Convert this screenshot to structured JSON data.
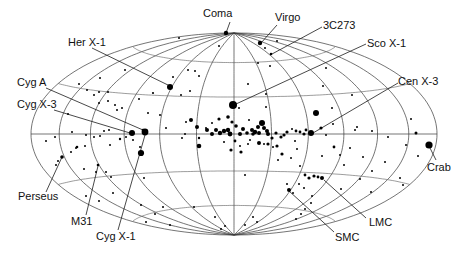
{
  "chart_data": {
    "type": "scatter",
    "title": "",
    "projection": "hammer-aitoff (galactic coordinates)",
    "xlabel": "",
    "ylabel": "",
    "grid": {
      "meridian_step_deg": 30,
      "parallel_step_deg": 30
    },
    "legend": null,
    "geometry": {
      "cx": 234,
      "cy": 134,
      "a": 203,
      "b": 101
    },
    "named_sources": [
      {
        "name": "Coma",
        "x": 226,
        "y": 33,
        "r": 2.2,
        "label_x": 203,
        "label_y": 17,
        "anchor": "start"
      },
      {
        "name": "Virgo",
        "x": 260,
        "y": 43,
        "r": 2.2,
        "label_x": 275,
        "label_y": 21,
        "anchor": "start"
      },
      {
        "name": "3C273",
        "x": 271,
        "y": 54,
        "r": 1.3,
        "label_x": 323,
        "label_y": 29,
        "anchor": "start"
      },
      {
        "name": "Sco X-1",
        "x": 233,
        "y": 105,
        "r": 4.0,
        "label_x": 367,
        "label_y": 47,
        "anchor": "start"
      },
      {
        "name": "Her X-1",
        "x": 170,
        "y": 87,
        "r": 3.0,
        "label_x": 68,
        "label_y": 46,
        "anchor": "start"
      },
      {
        "name": "Cyg A",
        "x": 143,
        "y": 130,
        "r": 1.3,
        "label_x": 17,
        "label_y": 86,
        "anchor": "start"
      },
      {
        "name": "Cyg X-3",
        "x": 132,
        "y": 133,
        "r": 3.0,
        "label_x": 17,
        "label_y": 108,
        "anchor": "start"
      },
      {
        "name": "Cen X-3",
        "x": 311,
        "y": 133,
        "r": 3.0,
        "label_x": 398,
        "label_y": 85,
        "anchor": "start"
      },
      {
        "name": "Crab",
        "x": 429,
        "y": 145,
        "r": 3.6,
        "label_x": 427,
        "label_y": 171,
        "anchor": "start"
      },
      {
        "name": "Perseus",
        "x": 62,
        "y": 157,
        "r": 1.8,
        "label_x": 18,
        "label_y": 200,
        "anchor": "start"
      },
      {
        "name": "M31",
        "x": 98,
        "y": 165,
        "r": 1.3,
        "label_x": 71,
        "label_y": 225,
        "anchor": "start"
      },
      {
        "name": "Cyg X-1",
        "x": 145,
        "y": 132,
        "r": 3.4,
        "label_x": 96,
        "label_y": 240,
        "anchor": "start"
      },
      {
        "name": "SMC",
        "x": 289,
        "y": 190,
        "r": 2.0,
        "label_x": 335,
        "label_y": 241,
        "anchor": "start"
      },
      {
        "name": "LMC",
        "x": 322,
        "y": 178,
        "r": 2.0,
        "label_x": 369,
        "label_y": 226,
        "anchor": "start"
      }
    ],
    "leader_lines": [
      {
        "name": "Coma",
        "from": [
          230,
          22
        ],
        "to": [
          226,
          33
        ]
      },
      {
        "name": "Virgo",
        "from": [
          277,
          25
        ],
        "to": [
          261,
          43
        ]
      },
      {
        "name": "3C273",
        "from": [
          322,
          27
        ],
        "to": [
          272,
          54
        ]
      },
      {
        "name": "Sco X-1",
        "from": [
          366,
          44
        ],
        "to": [
          236,
          104
        ]
      },
      {
        "name": "Her X-1",
        "from": [
          92,
          48
        ],
        "to": [
          170,
          86
        ]
      },
      {
        "name": "Cyg A",
        "from": [
          46,
          88
        ],
        "to": [
          143,
          130
        ]
      },
      {
        "name": "Cyg X-3",
        "from": [
          54,
          110
        ],
        "to": [
          130,
          133
        ]
      },
      {
        "name": "Cen X-3",
        "from": [
          398,
          83
        ],
        "to": [
          313,
          133
        ]
      },
      {
        "name": "Crab",
        "from": [
          436,
          160
        ],
        "to": [
          430,
          148
        ]
      },
      {
        "name": "Perseus",
        "from": [
          46,
          192
        ],
        "to": [
          62,
          157
        ]
      },
      {
        "name": "M31",
        "from": [
          86,
          215
        ],
        "to": [
          98,
          166
        ]
      },
      {
        "name": "Cyg X-1",
        "from": [
          118,
          230
        ],
        "to": [
          145,
          135
        ]
      },
      {
        "name": "SMC",
        "from": [
          334,
          232
        ],
        "to": [
          289,
          191
        ]
      },
      {
        "name": "LMC",
        "from": [
          366,
          218
        ],
        "to": [
          324,
          180
        ]
      }
    ],
    "sources": [
      [
        179,
        38,
        1.0
      ],
      [
        219,
        46,
        1.0
      ],
      [
        258,
        63,
        1.0
      ],
      [
        277,
        41,
        1.0
      ],
      [
        265,
        48,
        1.0
      ],
      [
        270,
        66,
        1.0
      ],
      [
        125,
        70,
        1.0
      ],
      [
        100,
        78,
        1.0
      ],
      [
        79,
        84,
        1.0
      ],
      [
        173,
        77,
        1.0
      ],
      [
        190,
        91,
        1.0
      ],
      [
        199,
        76,
        1.0
      ],
      [
        188,
        70,
        1.0
      ],
      [
        195,
        71,
        1.0
      ],
      [
        153,
        93,
        1.1
      ],
      [
        181,
        95,
        1.0
      ],
      [
        160,
        115,
        1.0
      ],
      [
        186,
        122,
        1.0
      ],
      [
        166,
        128,
        1.0
      ],
      [
        94,
        95,
        1.0
      ],
      [
        99,
        92,
        1.0
      ],
      [
        99,
        103,
        1.0
      ],
      [
        87,
        90,
        1.0
      ],
      [
        108,
        92,
        1.0
      ],
      [
        108,
        101,
        1.0
      ],
      [
        117,
        110,
        1.0
      ],
      [
        115,
        105,
        1.0
      ],
      [
        122,
        108,
        1.0
      ],
      [
        139,
        99,
        1.0
      ],
      [
        148,
        113,
        1.0
      ],
      [
        68,
        114,
        1.0
      ],
      [
        55,
        137,
        1.0
      ],
      [
        72,
        132,
        1.0
      ],
      [
        86,
        135,
        1.0
      ],
      [
        94,
        137,
        1.0
      ],
      [
        104,
        131,
        1.0
      ],
      [
        109,
        130,
        1.0
      ],
      [
        126,
        137,
        1.0
      ],
      [
        100,
        136,
        1.0
      ],
      [
        77,
        147,
        1.3
      ],
      [
        133,
        140,
        1.0
      ],
      [
        110,
        145,
        1.0
      ],
      [
        120,
        139,
        1.2
      ],
      [
        140,
        147,
        1.0
      ],
      [
        141,
        153,
        3.1
      ],
      [
        46,
        141,
        1.0
      ],
      [
        76,
        148,
        1.0
      ],
      [
        71,
        152,
        1.0
      ],
      [
        58,
        161,
        1.0
      ],
      [
        56,
        165,
        1.0
      ],
      [
        84,
        169,
        1.0
      ],
      [
        85,
        146,
        1.0
      ],
      [
        96,
        172,
        1.0
      ],
      [
        106,
        172,
        1.0
      ],
      [
        111,
        177,
        1.0
      ],
      [
        86,
        196,
        1.0
      ],
      [
        99,
        201,
        1.0
      ],
      [
        113,
        193,
        1.0
      ],
      [
        144,
        178,
        1.0
      ],
      [
        141,
        205,
        1.0
      ],
      [
        163,
        207,
        1.0
      ],
      [
        155,
        214,
        1.0
      ],
      [
        146,
        222,
        1.0
      ],
      [
        170,
        225,
        1.0
      ],
      [
        194,
        207,
        1.0
      ],
      [
        215,
        217,
        1.0
      ],
      [
        182,
        138,
        1.0
      ],
      [
        185,
        134,
        1.0
      ],
      [
        199,
        146,
        2.3
      ],
      [
        199,
        138,
        1.2
      ],
      [
        224,
        142,
        1.0
      ],
      [
        239,
        108,
        1.0
      ],
      [
        249,
        120,
        1.0
      ],
      [
        206,
        128,
        1.0
      ],
      [
        212,
        123,
        1.0
      ],
      [
        191,
        120,
        2.0
      ],
      [
        197,
        127,
        2.0
      ],
      [
        207,
        130,
        2.0
      ],
      [
        212,
        134,
        2.0
      ],
      [
        216,
        130,
        2.0
      ],
      [
        220,
        133,
        2.2
      ],
      [
        224,
        131,
        2.2
      ],
      [
        228,
        130,
        2.2
      ],
      [
        230,
        134,
        2.4
      ],
      [
        236,
        126,
        1.8
      ],
      [
        240,
        134,
        2.0
      ],
      [
        243,
        129,
        2.0
      ],
      [
        247,
        133,
        1.8
      ],
      [
        252,
        130,
        2.0
      ],
      [
        255,
        132,
        2.2
      ],
      [
        258,
        127,
        2.0
      ],
      [
        232,
        122,
        1.6
      ],
      [
        228,
        117,
        1.8
      ],
      [
        219,
        119,
        1.6
      ],
      [
        235,
        141,
        1.4
      ],
      [
        240,
        146,
        1.0
      ],
      [
        248,
        144,
        1.0
      ],
      [
        253,
        134,
        1.8
      ],
      [
        259,
        133,
        2.0
      ],
      [
        264,
        128,
        2.0
      ],
      [
        267,
        131,
        2.0
      ],
      [
        262,
        123,
        3.0
      ],
      [
        268,
        134,
        2.0
      ],
      [
        272,
        138,
        1.6
      ],
      [
        276,
        133,
        1.6
      ],
      [
        281,
        137,
        1.6
      ],
      [
        259,
        143,
        2.0
      ],
      [
        250,
        140,
        1.0
      ],
      [
        241,
        152,
        1.6
      ],
      [
        231,
        150,
        1.6
      ],
      [
        268,
        144,
        1.6
      ],
      [
        277,
        146,
        1.6
      ],
      [
        264,
        144,
        1.0
      ],
      [
        273,
        147,
        1.0
      ],
      [
        282,
        154,
        1.6
      ],
      [
        278,
        160,
        1.0
      ],
      [
        248,
        84,
        1.0
      ],
      [
        266,
        94,
        1.0
      ],
      [
        266,
        107,
        1.0
      ],
      [
        292,
        129,
        1.0
      ],
      [
        296,
        131,
        1.4
      ],
      [
        300,
        132,
        1.4
      ],
      [
        304,
        134,
        1.6
      ],
      [
        316,
        113,
        3.0
      ],
      [
        334,
        147,
        1.4
      ],
      [
        340,
        155,
        1.0
      ],
      [
        326,
        135,
        1.0
      ],
      [
        333,
        124,
        1.0
      ],
      [
        297,
        149,
        1.0
      ],
      [
        291,
        158,
        1.0
      ],
      [
        300,
        166,
        1.0
      ],
      [
        321,
        128,
        1.6
      ],
      [
        306,
        130,
        1.4
      ],
      [
        287,
        132,
        1.6
      ],
      [
        284,
        135,
        1.6
      ],
      [
        295,
        141,
        1.0
      ],
      [
        357,
        127,
        1.0
      ],
      [
        350,
        148,
        1.0
      ],
      [
        322,
        156,
        1.0
      ],
      [
        332,
        108,
        1.0
      ],
      [
        352,
        95,
        1.0
      ],
      [
        323,
        86,
        1.0
      ],
      [
        326,
        68,
        1.0
      ],
      [
        355,
        130,
        1.0
      ],
      [
        372,
        131,
        1.0
      ],
      [
        388,
        137,
        1.0
      ],
      [
        411,
        119,
        1.0
      ],
      [
        385,
        162,
        1.0
      ],
      [
        403,
        185,
        1.0
      ],
      [
        400,
        178,
        1.0
      ],
      [
        418,
        156,
        1.0
      ],
      [
        372,
        171,
        1.0
      ],
      [
        416,
        133,
        1.5
      ],
      [
        406,
        145,
        1.0
      ],
      [
        305,
        175,
        1.4
      ],
      [
        309,
        178,
        1.6
      ],
      [
        314,
        176,
        1.6
      ],
      [
        318,
        177,
        1.4
      ],
      [
        312,
        196,
        1.0
      ],
      [
        311,
        203,
        1.0
      ],
      [
        305,
        209,
        1.0
      ],
      [
        301,
        214,
        1.0
      ],
      [
        296,
        219,
        1.0
      ],
      [
        299,
        184,
        1.0
      ],
      [
        293,
        193,
        1.0
      ],
      [
        304,
        188,
        1.0
      ],
      [
        287,
        184,
        1.0
      ],
      [
        245,
        225,
        1.0
      ],
      [
        253,
        217,
        1.0
      ],
      [
        257,
        222,
        1.0
      ],
      [
        245,
        175,
        1.0
      ],
      [
        344,
        165,
        1.0
      ],
      [
        363,
        157,
        1.0
      ],
      [
        341,
        189,
        1.0
      ],
      [
        360,
        179,
        1.0
      ],
      [
        371,
        192,
        1.0
      ],
      [
        221,
        229,
        1.0
      ],
      [
        225,
        226,
        1.0
      ]
    ]
  }
}
